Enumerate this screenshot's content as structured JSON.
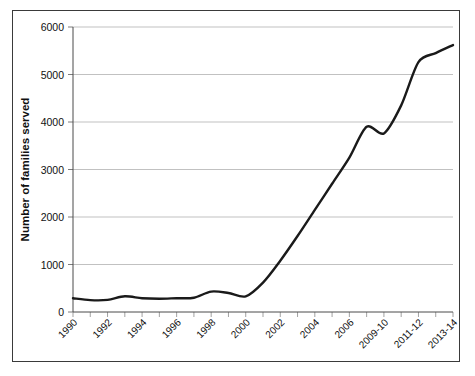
{
  "chart_data": {
    "type": "line",
    "title": "",
    "xlabel": "",
    "ylabel": "Number of families served",
    "ylim": [
      0,
      6000
    ],
    "ytick_labels": [
      "0",
      "1000",
      "2000",
      "3000",
      "4000",
      "5000",
      "6000"
    ],
    "ytick_values": [
      0,
      1000,
      2000,
      3000,
      4000,
      5000,
      6000
    ],
    "grid": true,
    "legend": "none",
    "x": [
      "1990",
      "1991",
      "1992",
      "1993",
      "1994",
      "1995",
      "1996",
      "1997",
      "1998",
      "1999",
      "2000",
      "2001",
      "2002",
      "2003",
      "2004",
      "2005",
      "2006",
      "2007-08",
      "2009-10",
      "2010-11",
      "2011-12",
      "2012-13",
      "2013-14"
    ],
    "xtick_labels_shown": [
      "1990",
      "1992",
      "1994",
      "1996",
      "1998",
      "2000",
      "2002",
      "2004",
      "2006",
      "2009-10",
      "2011-12",
      "2013-14"
    ],
    "values": [
      290,
      250,
      255,
      330,
      290,
      280,
      290,
      300,
      430,
      400,
      330,
      620,
      1080,
      1600,
      2150,
      2700,
      3250,
      3900,
      3760,
      4350,
      5260,
      5450,
      5620
    ],
    "series_name": "Families served",
    "line_color": "#1a1a1a",
    "grid_color": "#a6a6a6",
    "axis_color": "#4a4a4a",
    "background": "#ffffff"
  }
}
